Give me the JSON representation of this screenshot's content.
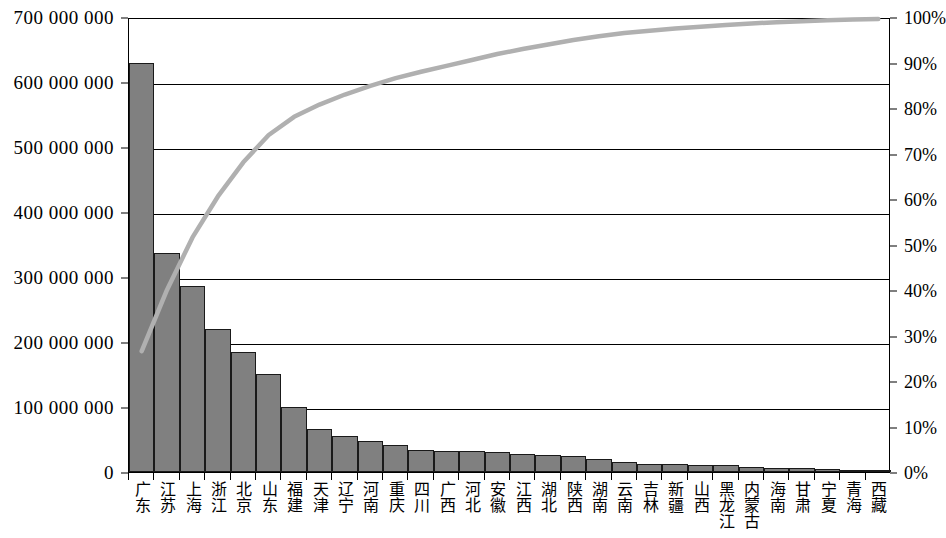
{
  "chart_data": {
    "type": "bar",
    "title": "",
    "xlabel": "",
    "ylabel": "",
    "ylim": [
      0,
      700000000
    ],
    "y2lim": [
      0,
      100
    ],
    "grid": true,
    "legend": false,
    "categories": [
      "广东",
      "江苏",
      "上海",
      "浙江",
      "北京",
      "山东",
      "福建",
      "天津",
      "辽宁",
      "河南",
      "重庆",
      "四川",
      "广西",
      "河北",
      "安徽",
      "江西",
      "湖北",
      "陕西",
      "湖南",
      "云南",
      "吉林",
      "新疆",
      "山西",
      "黑龙江",
      "内蒙古",
      "海南",
      "甘肃",
      "宁夏",
      "青海",
      "西藏"
    ],
    "series": [
      {
        "name": "金额",
        "type": "bar",
        "axis": "left",
        "values": [
          630000000,
          337000000,
          286000000,
          220000000,
          185000000,
          151000000,
          100000000,
          66000000,
          55000000,
          47000000,
          42000000,
          34000000,
          33000000,
          33000000,
          31000000,
          27000000,
          26000000,
          25000000,
          20000000,
          16000000,
          12000000,
          12000000,
          11000000,
          11000000,
          7000000,
          6000000,
          6000000,
          5000000,
          2000000,
          1000000
        ]
      },
      {
        "name": "累计百分比",
        "type": "line",
        "axis": "right",
        "values": [
          27.0,
          40.5,
          52.0,
          61.0,
          68.5,
          74.5,
          78.5,
          81.2,
          83.4,
          85.3,
          87.0,
          88.4,
          89.7,
          91.0,
          92.3,
          93.4,
          94.4,
          95.4,
          96.2,
          96.9,
          97.4,
          97.9,
          98.3,
          98.7,
          99.0,
          99.3,
          99.5,
          99.7,
          99.9,
          100.0
        ]
      }
    ],
    "y_left_ticks": [
      "0",
      "100 000 000",
      "200 000 000",
      "300 000 000",
      "400 000 000",
      "500 000 000",
      "600 000 000",
      "700 000 000"
    ],
    "y_left_tick_values": [
      0,
      100000000,
      200000000,
      300000000,
      400000000,
      500000000,
      600000000,
      700000000
    ],
    "y_right_ticks": [
      "0%",
      "10%",
      "20%",
      "30%",
      "40%",
      "50%",
      "60%",
      "70%",
      "80%",
      "90%",
      "100%"
    ],
    "y_right_tick_values": [
      0,
      10,
      20,
      30,
      40,
      50,
      60,
      70,
      80,
      90,
      100
    ],
    "colors": {
      "bar_fill": "#808080",
      "bar_stroke": "#1a1a1a",
      "line": "#b0b0b0",
      "grid": "#000000",
      "axis": "#000000",
      "background": "#ffffff"
    }
  }
}
